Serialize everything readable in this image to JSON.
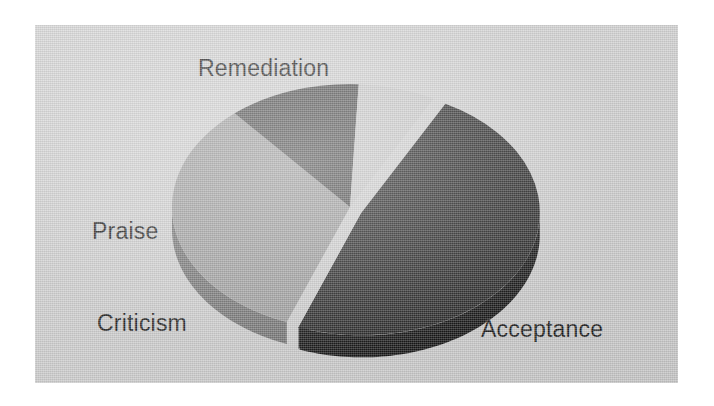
{
  "figure": {
    "name": "exploded-3d-pie-chart",
    "background_color": "#d0d0d0",
    "page_color": "#ffffff"
  },
  "labels": {
    "remediation": "Remediation",
    "praise": "Praise",
    "criticism": "Criticism",
    "acceptance": "Acceptance"
  },
  "chart_data": {
    "type": "pie",
    "title": "",
    "subtitle": "",
    "xlabel": "",
    "ylabel": "",
    "legend_position": "none",
    "grid": false,
    "style": "exploded-3d",
    "depth_px": 22,
    "explode_slice": "Acceptance",
    "start_angle_deg": -62,
    "direction": "clockwise",
    "categories": [
      "Acceptance",
      "Remediation",
      "Praise",
      "Criticism"
    ],
    "values": [
      48,
      33,
      12,
      7
    ],
    "value_unit": "percent",
    "colors": [
      "#1e1e1e",
      "#9a9a9a",
      "#474747",
      "#c8c8c8"
    ],
    "slices": [
      {
        "label": "Acceptance",
        "value": 48,
        "color": "#1e1e1e",
        "exploded": true,
        "side_color": "#0d0d0d"
      },
      {
        "label": "Remediation",
        "value": 33,
        "color": "#9a9a9a",
        "exploded": false,
        "side_color": "#6f6f6f"
      },
      {
        "label": "Praise",
        "value": 12,
        "color": "#474747",
        "exploded": false,
        "side_color": "#2e2e2e"
      },
      {
        "label": "Criticism",
        "value": 7,
        "color": "#c8c8c8",
        "exploded": false,
        "side_color": "#9c9c9c"
      }
    ]
  }
}
